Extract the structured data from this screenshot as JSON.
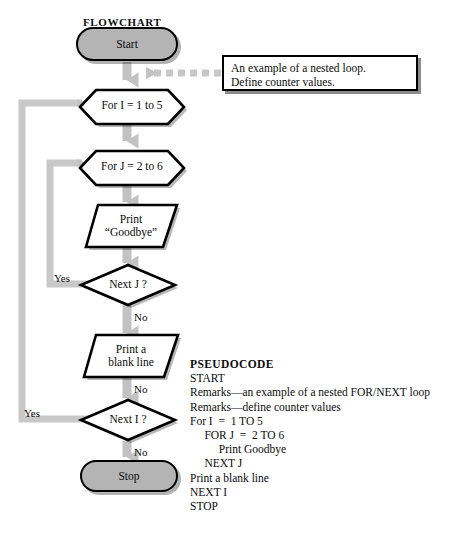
{
  "page": {
    "flowchart_heading": "FLOWCHART",
    "pseudocode_heading": "PSEUDOCODE",
    "accent_gray": "#b4b4b4",
    "connector_gray": "#c8c8c8",
    "outline_black": "#000000",
    "background": "#ffffff"
  },
  "flowchart": {
    "nodes": {
      "start": {
        "label": "Start",
        "type": "terminator"
      },
      "for_i": {
        "label": "For I  =  1 to 5",
        "type": "preparation"
      },
      "for_j": {
        "label": "For J  =  2 to 6",
        "type": "preparation"
      },
      "print_goodbye": {
        "label": "Print\n“Goodbye”",
        "type": "input-output"
      },
      "next_j": {
        "label": "Next J ?",
        "type": "decision"
      },
      "print_blank": {
        "label": "Print a\nblank line",
        "type": "input-output"
      },
      "next_i": {
        "label": "Next I ?",
        "type": "decision"
      },
      "stop": {
        "label": "Stop",
        "type": "terminator"
      }
    },
    "edge_labels": {
      "next_j_yes": "Yes",
      "next_j_no": "No",
      "next_i_yes": "Yes",
      "next_i_no": "No",
      "print_blank_no": "No"
    }
  },
  "annotation": {
    "text": "An example of a nested loop.\nDefine counter values."
  },
  "pseudocode": {
    "lines": [
      "START",
      "Remarks—an example of a nested FOR/NEXT loop",
      "Remarks—define counter values",
      "For I  =  1 TO 5",
      "     FOR J  =  2 TO 6",
      "          Print Goodbye",
      "     NEXT J",
      "Print a blank line",
      "NEXT I",
      "STOP"
    ]
  }
}
